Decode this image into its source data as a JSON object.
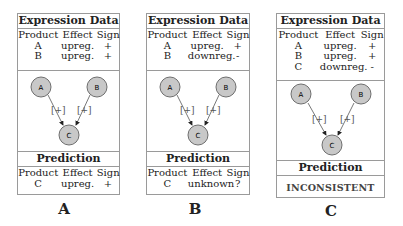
{
  "panels": [
    {
      "id": "A",
      "label": "A",
      "expression_title": "Expression Data",
      "columns": [
        "Product",
        "Effect",
        "Sign"
      ],
      "expression_rows": [
        {
          "product": "A",
          "effect": "upreg.",
          "sign": "+"
        },
        {
          "product": "B",
          "effect": "upreg.",
          "sign": "+"
        }
      ],
      "graph": {
        "nodes": [
          "A",
          "B",
          "C"
        ],
        "edges": [
          {
            "from": "A",
            "to": "C",
            "label": "[+]"
          },
          {
            "from": "B",
            "to": "C",
            "label": "[+]"
          }
        ]
      },
      "prediction_title": "Prediction",
      "prediction_rows": [
        {
          "product": "C",
          "effect": "upreg.",
          "sign": "+"
        }
      ]
    },
    {
      "id": "B",
      "label": "B",
      "expression_title": "Expression Data",
      "columns": [
        "Product",
        "Effect",
        "Sign"
      ],
      "expression_rows": [
        {
          "product": "A",
          "effect": "upreg.",
          "sign": "+"
        },
        {
          "product": "B",
          "effect": "downreg.",
          "sign": "-"
        }
      ],
      "graph": {
        "nodes": [
          "A",
          "B",
          "C"
        ],
        "edges": [
          {
            "from": "A",
            "to": "C",
            "label": "[+]"
          },
          {
            "from": "B",
            "to": "C",
            "label": "[+]"
          }
        ]
      },
      "prediction_title": "Prediction",
      "prediction_rows": [
        {
          "product": "C",
          "effect": "unknown",
          "sign": "?"
        }
      ]
    },
    {
      "id": "C",
      "label": "C",
      "expression_title": "Expression Data",
      "columns": [
        "Product",
        "Effect",
        "Sign"
      ],
      "expression_rows": [
        {
          "product": "A",
          "effect": "upreg.",
          "sign": "+"
        },
        {
          "product": "B",
          "effect": "upreg.",
          "sign": "+"
        },
        {
          "product": "C",
          "effect": "downreg.",
          "sign": "-"
        }
      ],
      "graph": {
        "nodes": [
          "A",
          "B",
          "C"
        ],
        "edges": [
          {
            "from": "A",
            "to": "C",
            "label": "[+]"
          },
          {
            "from": "B",
            "to": "C",
            "label": "[+]"
          }
        ]
      },
      "prediction_title": "Prediction",
      "prediction_result": "INCONSISTENT"
    }
  ],
  "colors": {
    "node_fill": "#c8c8c8",
    "node_stroke": "#6e6e6e",
    "border": "#9a9a9a",
    "text": "#222222"
  }
}
